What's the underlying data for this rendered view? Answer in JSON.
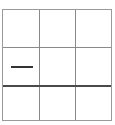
{
  "board": {
    "rows": 3,
    "cols": 3,
    "cells": [
      [
        "",
        "",
        ""
      ],
      [
        "—",
        "",
        ""
      ],
      [
        "",
        "",
        ""
      ]
    ],
    "line_color": "#8a8a8a",
    "thick_line_color": "#4a4a4a",
    "mark_color": "#333333"
  }
}
